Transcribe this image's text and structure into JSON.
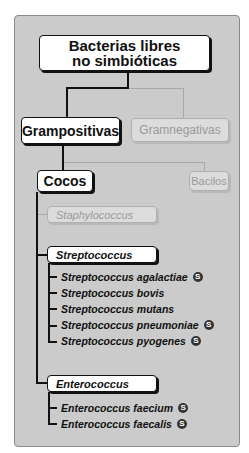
{
  "diagram": {
    "root": {
      "line1": "Bacterias libres",
      "line2": "no simbióticas"
    },
    "gram": [
      {
        "label": "Grampositivas",
        "active": true
      },
      {
        "label": "Gramnegativas",
        "active": false
      }
    ],
    "shape": [
      {
        "label": "Cocos",
        "active": true
      },
      {
        "label": "Bacilos",
        "active": false
      }
    ],
    "genera": [
      {
        "label": "Staphylococcus",
        "active": false,
        "species": []
      },
      {
        "label": "Streptococcus",
        "active": true,
        "species": [
          {
            "name": "Streptococcus agalactiae",
            "badge": "S"
          },
          {
            "name": "Streptococcus bovis",
            "badge": null
          },
          {
            "name": "Streptococcus mutans",
            "badge": null
          },
          {
            "name": "Streptococcus pneumoniae",
            "badge": "S"
          },
          {
            "name": "Streptococcus pyogenes",
            "badge": "S"
          }
        ]
      },
      {
        "label": "Enterococcus",
        "active": true,
        "species": [
          {
            "name": "Enterococcus faecium",
            "badge": "S"
          },
          {
            "name": "Enterococcus faecalis",
            "badge": "S"
          }
        ]
      }
    ],
    "colors": {
      "panel": "#cbcbcb",
      "active_border": "#111111",
      "inactive_text": "#9a9a9a"
    }
  }
}
